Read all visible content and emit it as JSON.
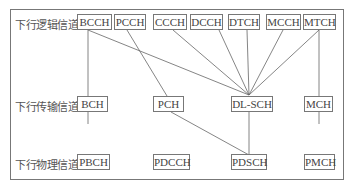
{
  "rows": {
    "logical": {
      "label": "下行逻辑信道",
      "channels": [
        "BCCH",
        "PCCH",
        "CCCH",
        "DCCH",
        "DTCH",
        "MCCH",
        "MTCH"
      ]
    },
    "transport": {
      "label": "下行传输信道",
      "channels": [
        "BCH",
        "PCH",
        "DL-SCH",
        "MCH"
      ]
    },
    "physical": {
      "label": "下行物理信道",
      "channels": [
        "PBCH",
        "PDCCH",
        "PDSCH",
        "PMCH"
      ]
    }
  },
  "mappings": [
    [
      "BCCH",
      "BCH"
    ],
    [
      "BCCH",
      "DL-SCH"
    ],
    [
      "PCCH",
      "PCH"
    ],
    [
      "CCCH",
      "DL-SCH"
    ],
    [
      "DCCH",
      "DL-SCH"
    ],
    [
      "DTCH",
      "DL-SCH"
    ],
    [
      "MCCH",
      "DL-SCH"
    ],
    [
      "MTCH",
      "DL-SCH"
    ],
    [
      "MTCH",
      "MCH"
    ],
    [
      "BCH",
      "PBCH"
    ],
    [
      "PCH",
      "PDSCH"
    ],
    [
      "DL-SCH",
      "PDSCH"
    ],
    [
      "MCH",
      "PMCH"
    ]
  ]
}
